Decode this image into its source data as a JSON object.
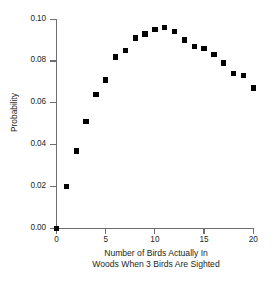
{
  "figure": {
    "background": "#ffffff",
    "marker_color": "#000000",
    "axis_color": "#6d6e71",
    "text_color": "#231f20"
  },
  "axes": {
    "y_title": "Probability",
    "x_title_line1": "Number of Birds Actually In",
    "x_title_line2": "Woods When 3 Birds Are Sighted",
    "y_ticks": [
      "0.00",
      "0.02",
      "0.04",
      "0.06",
      "0.08",
      "0.10"
    ],
    "y_tick_values": [
      0.0,
      0.02,
      0.04,
      0.06,
      0.08,
      0.1
    ],
    "x_ticks": [
      "0",
      "5",
      "10",
      "15",
      "20"
    ],
    "x_tick_values": [
      0,
      5,
      10,
      15,
      20
    ]
  },
  "chart_data": {
    "type": "scatter",
    "title": "",
    "xlabel": "Number of Birds Actually In Woods When 3 Birds Are Sighted",
    "ylabel": "Probability",
    "xlim": [
      0,
      20
    ],
    "ylim": [
      0,
      0.1
    ],
    "grid": false,
    "legend": "none",
    "marker": "square",
    "x": [
      0,
      1,
      2,
      3,
      4,
      5,
      6,
      7,
      8,
      9,
      10,
      11,
      12,
      13,
      14,
      15,
      16,
      17,
      18,
      19,
      20
    ],
    "values": [
      0.0,
      0.02,
      0.037,
      0.051,
      0.064,
      0.071,
      0.082,
      0.085,
      0.091,
      0.093,
      0.095,
      0.096,
      0.094,
      0.09,
      0.087,
      0.086,
      0.083,
      0.079,
      0.074,
      0.073,
      0.067
    ],
    "points": [
      {
        "x": 0,
        "y": 0.0
      },
      {
        "x": 1,
        "y": 0.02
      },
      {
        "x": 2,
        "y": 0.037
      },
      {
        "x": 3,
        "y": 0.051
      },
      {
        "x": 4,
        "y": 0.064
      },
      {
        "x": 5,
        "y": 0.071
      },
      {
        "x": 6,
        "y": 0.082
      },
      {
        "x": 7,
        "y": 0.085
      },
      {
        "x": 8,
        "y": 0.091
      },
      {
        "x": 9,
        "y": 0.093
      },
      {
        "x": 10,
        "y": 0.095
      },
      {
        "x": 11,
        "y": 0.096
      },
      {
        "x": 12,
        "y": 0.094
      },
      {
        "x": 13,
        "y": 0.09
      },
      {
        "x": 14,
        "y": 0.087
      },
      {
        "x": 15,
        "y": 0.086
      },
      {
        "x": 16,
        "y": 0.083
      },
      {
        "x": 17,
        "y": 0.079
      },
      {
        "x": 18,
        "y": 0.074
      },
      {
        "x": 19,
        "y": 0.073
      },
      {
        "x": 20,
        "y": 0.067
      }
    ]
  }
}
